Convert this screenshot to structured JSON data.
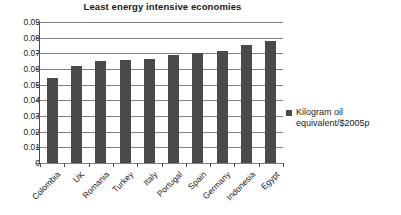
{
  "chart_data": {
    "type": "bar",
    "title": "Least energy intensive economies",
    "xlabel": "",
    "ylabel": "",
    "ylim": [
      0,
      0.09
    ],
    "ytick_step": 0.01,
    "grid": true,
    "legend_position": "right",
    "bar_color": "#4a4a4a",
    "categories": [
      "Colombia",
      "UK",
      "Romania",
      "Turkey",
      "Italy",
      "Portugal",
      "Spain",
      "Germany",
      "Indonesia",
      "Egypt"
    ],
    "series": [
      {
        "name": "Kilogram oil equivalent/$2005p",
        "values": [
          0.054,
          0.062,
          0.065,
          0.0658,
          0.0665,
          0.069,
          0.0702,
          0.0715,
          0.0755,
          0.0777
        ]
      }
    ],
    "ytick_labels": [
      "0.09",
      "0.08",
      "0.07",
      "0.06",
      "0.05",
      "0.04",
      "0.03",
      "0.02",
      "0.01",
      "0"
    ],
    "ytick_values": [
      0.09,
      0.08,
      0.07,
      0.06,
      0.05,
      0.04,
      0.03,
      0.02,
      0.01,
      0
    ]
  },
  "legend": {
    "entries": [
      {
        "label": "Kilogram oil equivalent/$2005p",
        "color": "#4a4a4a"
      }
    ]
  }
}
